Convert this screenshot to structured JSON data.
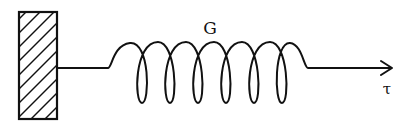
{
  "diagram": {
    "type": "mechanical-spring",
    "wall": {
      "label": "",
      "style": "hatched"
    },
    "spring": {
      "label": "G",
      "coils": 6
    },
    "force": {
      "label": "τ",
      "direction": "right"
    },
    "colors": {
      "stroke": "#111111",
      "background": "#ffffff"
    }
  }
}
